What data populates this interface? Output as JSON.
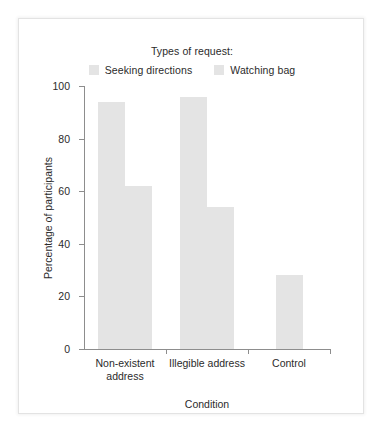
{
  "figure": {
    "legend_title": "Types of request:",
    "bar_color": "#e4e4e4",
    "axis_color": "#8d8d8d",
    "text_color": "#2b2b2b"
  },
  "chart_data": {
    "type": "bar",
    "title": "",
    "xlabel": "Condition",
    "ylabel": "Percentage of participants",
    "ylim": [
      0,
      100
    ],
    "yticks": [
      0,
      20,
      40,
      60,
      80,
      100
    ],
    "ytick_labels": [
      "0",
      "20",
      "40",
      "60",
      "80",
      "100"
    ],
    "grid": false,
    "legend_position": "top-center",
    "categories": [
      "Non-existent\naddress",
      "Illegible address",
      "Control"
    ],
    "series": [
      {
        "name": "Seeking directions",
        "color": "#e4e4e4",
        "values": [
          94,
          96,
          null
        ]
      },
      {
        "name": "Watching bag",
        "color": "#e4e4e4",
        "values": [
          62,
          54,
          28
        ]
      }
    ]
  }
}
